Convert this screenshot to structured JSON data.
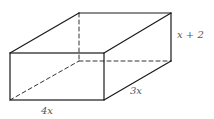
{
  "figure": {
    "type": "rectangular-prism",
    "labels": {
      "length": "4x",
      "width": "3x",
      "height": "x + 2"
    },
    "colors": {
      "edge": "#1a1a1a",
      "hidden_edge": "#333333",
      "label": "#555555",
      "background": "#ffffff"
    },
    "vertices": {
      "front_top_left": [
        10,
        53
      ],
      "front_top_right": [
        104,
        53
      ],
      "front_bottom_left": [
        10,
        100
      ],
      "front_bottom_right": [
        104,
        100
      ],
      "back_top_left": [
        79,
        13
      ],
      "back_top_right": [
        171,
        13
      ],
      "back_bottom_left": [
        79,
        61
      ],
      "back_bottom_right": [
        171,
        61
      ]
    }
  }
}
